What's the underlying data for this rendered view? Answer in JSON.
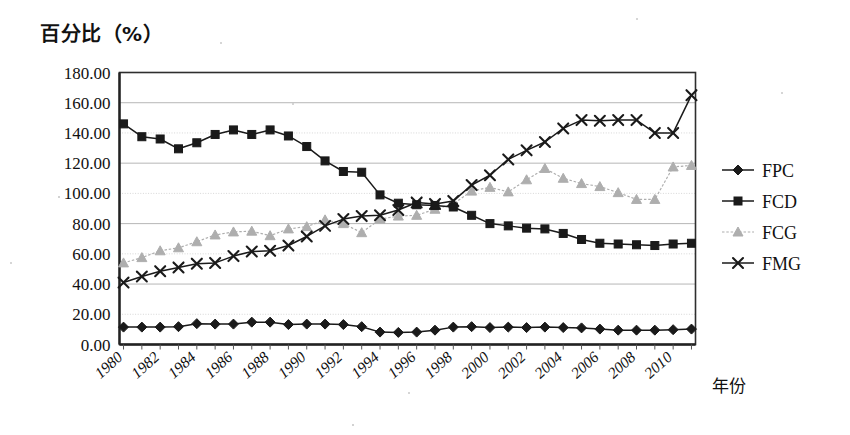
{
  "chart_data": {
    "type": "line",
    "title": "",
    "xlabel": "年份",
    "ylabel": "百分比（%）",
    "ylim": [
      0,
      180
    ],
    "ytick_step": 20,
    "ytick_labels": [
      "0.00",
      "20.00",
      "40.00",
      "60.00",
      "80.00",
      "100.00",
      "120.00",
      "140.00",
      "160.00",
      "180.00"
    ],
    "xlim": [
      1980,
      2011
    ],
    "xtick_labels": [
      "1980",
      "1982",
      "1984",
      "1986",
      "1988",
      "1990",
      "1992",
      "1994",
      "1996",
      "1998",
      "2000",
      "2002",
      "2004",
      "2006",
      "2008",
      "2010"
    ],
    "x": [
      1980,
      1981,
      1982,
      1983,
      1984,
      1985,
      1986,
      1987,
      1988,
      1989,
      1990,
      1991,
      1992,
      1993,
      1994,
      1995,
      1996,
      1997,
      1998,
      1999,
      2000,
      2001,
      2002,
      2003,
      2004,
      2005,
      2006,
      2007,
      2008,
      2009,
      2010,
      2011
    ],
    "grid": true,
    "legend_position": "right",
    "series": [
      {
        "name": "FPC",
        "marker": "diamond",
        "color": "#1a1a1a",
        "values": [
          11.5,
          11.5,
          11.5,
          11.8,
          13.8,
          13.5,
          13.5,
          14.8,
          14.8,
          13.2,
          13.5,
          13.5,
          13.2,
          11.8,
          8.2,
          8.0,
          8.2,
          9.5,
          11.5,
          11.8,
          11.2,
          11.5,
          11.2,
          11.5,
          11.2,
          11.0,
          10.2,
          9.5,
          9.5,
          9.5,
          9.8,
          10.2
        ]
      },
      {
        "name": "FCD",
        "marker": "square",
        "color": "#1a1a1a",
        "values": [
          146.0,
          137.5,
          136.0,
          129.5,
          133.5,
          139.0,
          142.0,
          139.0,
          142.0,
          138.0,
          131.0,
          121.5,
          114.5,
          114.0,
          99.0,
          93.5,
          92.5,
          92.0,
          91.0,
          85.5,
          80.0,
          78.5,
          77.0,
          76.5,
          73.5,
          69.5,
          67.0,
          66.5,
          66.0,
          65.5,
          66.5,
          67.0
        ]
      },
      {
        "name": "FCG",
        "marker": "triangle",
        "color": "#aeaeae",
        "values": [
          54.0,
          57.5,
          62.0,
          64.0,
          68.0,
          72.5,
          74.5,
          75.0,
          72.0,
          76.5,
          78.0,
          82.5,
          80.0,
          74.0,
          83.0,
          85.0,
          85.5,
          89.5,
          93.0,
          101.5,
          104.0,
          101.0,
          109.0,
          116.5,
          110.0,
          106.5,
          104.5,
          100.5,
          96.0,
          96.0,
          117.5,
          118.5
        ]
      },
      {
        "name": "FMG",
        "marker": "x",
        "color": "#1a1a1a",
        "values": [
          41.0,
          45.0,
          48.5,
          51.0,
          53.5,
          54.0,
          58.5,
          61.5,
          62.0,
          65.5,
          71.5,
          78.5,
          83.0,
          85.0,
          85.5,
          89.0,
          94.0,
          93.0,
          95.0,
          105.5,
          112.0,
          122.5,
          128.5,
          134.0,
          143.0,
          148.5,
          148.0,
          148.5,
          148.5,
          140.0,
          140.0,
          165.0
        ]
      }
    ]
  },
  "legend": {
    "items": [
      {
        "label": "FPC"
      },
      {
        "label": "FCD"
      },
      {
        "label": "FCG"
      },
      {
        "label": "FMG"
      }
    ]
  }
}
